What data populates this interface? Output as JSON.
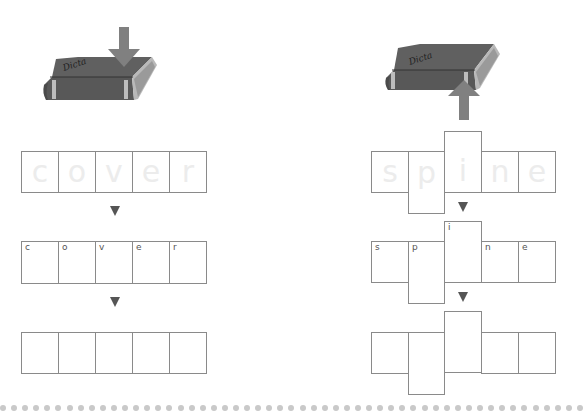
{
  "left_panel": {
    "word": "cover",
    "arrow_direction": "down",
    "traced_letters": [
      "c",
      "o",
      "v",
      "e",
      "r"
    ],
    "hint_letters": [
      "c",
      "o",
      "v",
      "e",
      "r"
    ],
    "blank_cells": 5
  },
  "right_panel": {
    "word": "spine",
    "arrow_direction": "up",
    "traced_letters": [
      "s",
      "p",
      "i",
      "n",
      "e"
    ],
    "hint_letters": [
      "s",
      "p",
      "i",
      "n",
      "e"
    ],
    "blank_cells": 5
  },
  "colors": {
    "book": "#5a5a5a",
    "arrow": "#808080",
    "cell_border": "#8a8a8a",
    "dots": "#c9c9c9"
  }
}
